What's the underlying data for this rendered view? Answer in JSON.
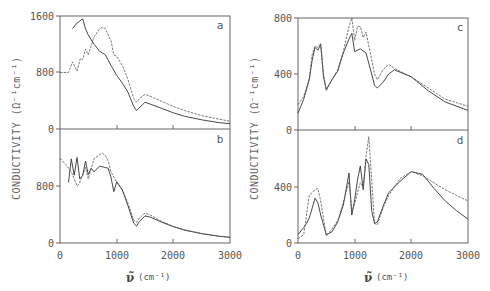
{
  "chart_data": [
    {
      "type": "line",
      "panel": "a",
      "xlabel": "ν̃ (cm⁻¹)",
      "ylabel": "CONDUCTIVITY (Ω⁻¹cm⁻¹)",
      "xlim": [
        0,
        3000
      ],
      "ylim": [
        0,
        1600
      ],
      "yticks": [
        "0",
        "800",
        "1600"
      ],
      "xticks": [
        0,
        1000,
        2000,
        3000
      ],
      "series": [
        {
          "name": "solid",
          "x": [
            220,
            300,
            400,
            450,
            500,
            600,
            700,
            800,
            900,
            1000,
            1100,
            1200,
            1300,
            1350,
            1400,
            1500,
            1600,
            1800,
            2000,
            2200,
            2500,
            2800,
            3000
          ],
          "y": [
            1420,
            1500,
            1560,
            1420,
            1330,
            1200,
            1100,
            1050,
            900,
            760,
            650,
            520,
            320,
            260,
            300,
            380,
            350,
            290,
            230,
            180,
            130,
            90,
            75
          ]
        },
        {
          "name": "dashed",
          "x": [
            0,
            150,
            220,
            300,
            360,
            400,
            450,
            500,
            600,
            700,
            750,
            800,
            900,
            950,
            1000,
            1100,
            1200,
            1300,
            1350,
            1400,
            1500,
            1600,
            1800,
            2000,
            2200,
            2500,
            2800,
            3000
          ],
          "y": [
            800,
            800,
            950,
            820,
            1000,
            980,
            1130,
            1050,
            1300,
            1420,
            1440,
            1420,
            1250,
            1050,
            1030,
            900,
            700,
            430,
            380,
            430,
            490,
            460,
            390,
            320,
            260,
            190,
            140,
            110
          ]
        }
      ]
    },
    {
      "type": "line",
      "panel": "b",
      "xlabel": "ν̃ (cm⁻¹)",
      "ylabel": "CONDUCTIVITY (Ω⁻¹cm⁻¹)",
      "xlim": [
        0,
        3000
      ],
      "ylim": [
        0,
        1600
      ],
      "yticks": [
        "0",
        "800"
      ],
      "xticks": [
        "0",
        "1000",
        "2000",
        "3000"
      ],
      "series": [
        {
          "name": "solid",
          "x": [
            150,
            200,
            250,
            300,
            350,
            400,
            450,
            500,
            550,
            600,
            700,
            800,
            850,
            900,
            950,
            1000,
            1100,
            1200,
            1300,
            1350,
            1400,
            1500,
            1600,
            1800,
            2000,
            2200,
            2500,
            2800,
            3000
          ],
          "y": [
            850,
            1180,
            950,
            1200,
            900,
            950,
            1150,
            960,
            1050,
            1000,
            1080,
            1060,
            1050,
            920,
            720,
            860,
            750,
            520,
            280,
            240,
            300,
            380,
            360,
            290,
            230,
            180,
            130,
            95,
            80
          ]
        },
        {
          "name": "dashed",
          "x": [
            0,
            100,
            200,
            300,
            330,
            400,
            450,
            500,
            600,
            700,
            750,
            800,
            850,
            900,
            1000,
            1100,
            1200,
            1300,
            1350,
            1400,
            1500,
            1600,
            1800,
            2000,
            2200,
            2500,
            2800,
            3000
          ],
          "y": [
            1190,
            1100,
            1000,
            800,
            820,
            950,
            1060,
            900,
            1180,
            1240,
            1260,
            1230,
            1150,
            1000,
            850,
            740,
            560,
            320,
            290,
            350,
            420,
            390,
            300,
            235,
            185,
            135,
            95,
            80
          ]
        }
      ]
    },
    {
      "type": "line",
      "panel": "c",
      "xlabel": "ν̃ (cm⁻¹)",
      "ylabel": "CONDUCTIVITY (Ω⁻¹cm⁻¹)",
      "xlim": [
        0,
        3000
      ],
      "ylim": [
        0,
        800
      ],
      "yticks": [
        "0",
        "400",
        "800"
      ],
      "xticks": [
        0,
        1000,
        2000,
        3000
      ],
      "series": [
        {
          "name": "solid",
          "x": [
            0,
            100,
            200,
            250,
            300,
            350,
            400,
            450,
            500,
            600,
            700,
            800,
            900,
            950,
            1000,
            1100,
            1200,
            1300,
            1350,
            1400,
            1500,
            1600,
            1700,
            2000,
            2300,
            2600,
            3000
          ],
          "y": [
            120,
            220,
            360,
            500,
            590,
            570,
            610,
            380,
            290,
            360,
            420,
            550,
            650,
            690,
            560,
            580,
            550,
            400,
            320,
            300,
            340,
            400,
            430,
            380,
            280,
            200,
            140
          ]
        },
        {
          "name": "dashed",
          "x": [
            0,
            100,
            200,
            250,
            300,
            350,
            400,
            450,
            500,
            600,
            700,
            800,
            900,
            950,
            1000,
            1050,
            1100,
            1150,
            1200,
            1300,
            1350,
            1400,
            1500,
            1600,
            1700,
            2000,
            2300,
            2600,
            3000
          ],
          "y": [
            180,
            240,
            370,
            540,
            600,
            590,
            620,
            400,
            280,
            360,
            430,
            560,
            740,
            800,
            640,
            740,
            740,
            660,
            700,
            500,
            400,
            360,
            430,
            470,
            440,
            380,
            300,
            220,
            170
          ]
        }
      ]
    },
    {
      "type": "line",
      "panel": "d",
      "xlabel": "ν̃ (cm⁻¹)",
      "ylabel": "CONDUCTIVITY (Ω⁻¹cm⁻¹)",
      "xlim": [
        0,
        3000
      ],
      "ylim": [
        0,
        800
      ],
      "yticks": [
        "0",
        "400"
      ],
      "xticks": [
        "0",
        "1000",
        "2000",
        "3000"
      ],
      "series": [
        {
          "name": "solid",
          "x": [
            0,
            100,
            150,
            200,
            250,
            300,
            350,
            400,
            500,
            600,
            700,
            800,
            900,
            950,
            1000,
            1050,
            1100,
            1150,
            1200,
            1250,
            1300,
            1350,
            1400,
            1500,
            1600,
            1800,
            2000,
            2200,
            2400,
            2600,
            2800,
            3000
          ],
          "y": [
            60,
            110,
            140,
            180,
            250,
            320,
            290,
            200,
            60,
            80,
            150,
            270,
            500,
            200,
            310,
            450,
            550,
            380,
            600,
            560,
            230,
            140,
            150,
            260,
            360,
            440,
            510,
            490,
            390,
            300,
            230,
            170
          ]
        },
        {
          "name": "dashed",
          "x": [
            0,
            100,
            200,
            250,
            300,
            350,
            400,
            500,
            600,
            700,
            800,
            900,
            950,
            1000,
            1050,
            1100,
            1150,
            1200,
            1250,
            1300,
            1350,
            1400,
            1500,
            1600,
            1800,
            2000,
            2200,
            2400,
            2600,
            2800,
            3000
          ],
          "y": [
            30,
            60,
            340,
            360,
            380,
            390,
            300,
            50,
            100,
            160,
            290,
            440,
            220,
            280,
            360,
            430,
            400,
            620,
            760,
            450,
            140,
            130,
            250,
            340,
            460,
            510,
            480,
            430,
            380,
            340,
            300
          ]
        }
      ]
    }
  ],
  "labels": {
    "ylabel": "CONDUCTIVITY (Ω⁻¹cm⁻¹)",
    "xlabel_symbol": "ν̃",
    "xlabel_unit": "(cm⁻¹)",
    "panel_a": "a",
    "panel_b": "b",
    "panel_c": "c",
    "panel_d": "d",
    "left": {
      "a_yticks": [
        "0",
        "800",
        "1600"
      ],
      "b_yticks": [
        "0",
        "800"
      ],
      "xticks": [
        "0",
        "1000",
        "2000",
        "3000"
      ]
    },
    "right": {
      "c_yticks": [
        "0",
        "400",
        "800"
      ],
      "d_yticks": [
        "0",
        "400"
      ],
      "xticks": [
        "0",
        "1000",
        "2000",
        "3000"
      ]
    }
  }
}
